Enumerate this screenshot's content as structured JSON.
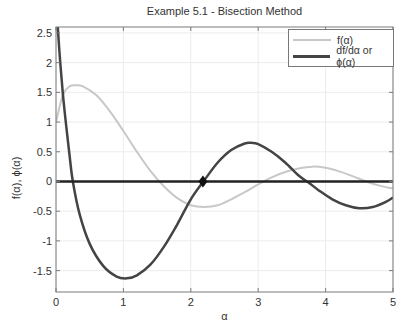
{
  "chart_data": {
    "type": "line",
    "title": "Example 5.1 - Bisection Method",
    "xlabel": "α",
    "ylabel": "f(α), ϕ(α)",
    "xlim": [
      0,
      5
    ],
    "ylim": [
      -1.86,
      2.6
    ],
    "xticks": [
      0,
      1,
      2,
      3,
      4,
      5
    ],
    "yticks": [
      -1.5,
      -1,
      -0.5,
      0,
      0.5,
      1,
      1.5,
      2,
      2.5
    ],
    "grid": true,
    "legend_position": "upper right",
    "series": [
      {
        "name": "f(α)",
        "color": "#c8c8c8",
        "width": 2,
        "x": [
          0,
          0.1,
          0.2,
          0.3,
          0.4,
          0.6,
          0.8,
          1.0,
          1.2,
          1.4,
          1.6,
          1.8,
          2.0,
          2.2,
          2.4,
          2.6,
          2.8,
          3.0,
          3.2,
          3.4,
          3.6,
          3.8,
          4.0,
          4.2,
          4.4,
          4.6,
          4.8,
          5.0
        ],
        "y": [
          1.0,
          1.45,
          1.6,
          1.62,
          1.6,
          1.45,
          1.18,
          0.85,
          0.5,
          0.18,
          -0.08,
          -0.28,
          -0.4,
          -0.43,
          -0.4,
          -0.3,
          -0.18,
          -0.05,
          0.07,
          0.16,
          0.22,
          0.25,
          0.23,
          0.17,
          0.09,
          0.0,
          -0.07,
          -0.12
        ]
      },
      {
        "name": "df/dα or ϕ(α)",
        "color": "#444444",
        "width": 2.5,
        "x": [
          0.01,
          0.05,
          0.1,
          0.15,
          0.2,
          0.25,
          0.35,
          0.5,
          0.7,
          0.9,
          1.05,
          1.2,
          1.4,
          1.6,
          1.8,
          2.0,
          2.2,
          2.4,
          2.6,
          2.8,
          2.9,
          3.0,
          3.2,
          3.4,
          3.6,
          3.75,
          3.9,
          4.1,
          4.3,
          4.5,
          4.7,
          4.9,
          5.0
        ],
        "y": [
          2.9,
          2.2,
          1.5,
          0.95,
          0.45,
          0.0,
          -0.55,
          -1.05,
          -1.42,
          -1.6,
          -1.63,
          -1.58,
          -1.4,
          -1.1,
          -0.72,
          -0.3,
          0.02,
          0.32,
          0.53,
          0.64,
          0.65,
          0.63,
          0.5,
          0.32,
          0.1,
          -0.02,
          -0.15,
          -0.3,
          -0.4,
          -0.45,
          -0.43,
          -0.34,
          -0.27
        ]
      },
      {
        "name": "zero-line",
        "color": "#222222",
        "width": 2.5,
        "x": [
          0,
          5
        ],
        "y": [
          0,
          0
        ]
      }
    ],
    "annotations": [
      {
        "type": "marker",
        "shape": "diamond",
        "x": 2.18,
        "y": 0,
        "color": "#111111"
      }
    ]
  },
  "legend": {
    "items": [
      {
        "label": "f(α)"
      },
      {
        "label": "df/dα or ϕ(α)"
      }
    ]
  }
}
